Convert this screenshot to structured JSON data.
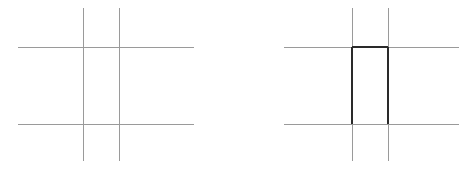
{
  "figure": {
    "background_color": "#ffffff",
    "width": 466,
    "height": 170,
    "panel_count": 2
  },
  "colors": {
    "grid_line": "#9a9a9a",
    "highlight_line": "#2a2a2a",
    "background": "#ffffff"
  },
  "strokes": {
    "grid_width": 1,
    "highlight_width": 2
  },
  "panels": [
    {
      "id": "left",
      "name": "plain-grid-panel",
      "caption": "",
      "origin_x": 0,
      "highlight": false,
      "vertical_lines": [
        {
          "name": "vertical-line-1",
          "x": 83,
          "y1": 8,
          "y2": 161
        },
        {
          "name": "vertical-line-2",
          "x": 119,
          "y1": 8,
          "y2": 161
        }
      ],
      "horizontal_lines": [
        {
          "name": "horizontal-line-top",
          "y": 47,
          "x1": 18,
          "x2": 194
        },
        {
          "name": "horizontal-line-bottom",
          "y": 124,
          "x1": 18,
          "x2": 194
        }
      ]
    },
    {
      "id": "right",
      "name": "highlighted-grid-panel",
      "caption": "",
      "origin_x": 233,
      "highlight": true,
      "vertical_lines": [
        {
          "name": "vertical-line-1",
          "x": 119,
          "y1": 8,
          "y2": 161
        },
        {
          "name": "vertical-line-2",
          "x": 155,
          "y1": 8,
          "y2": 161
        }
      ],
      "horizontal_lines": [
        {
          "name": "horizontal-line-top",
          "y": 47,
          "x1": 51,
          "x2": 226
        },
        {
          "name": "horizontal-line-bottom",
          "y": 124,
          "x1": 51,
          "x2": 226
        }
      ],
      "highlight_cell": {
        "name": "selected-cell",
        "left": 119,
        "right": 155,
        "top": 47,
        "bottom": 124,
        "edges_drawn": [
          "top",
          "left",
          "right"
        ],
        "bottom_edge_drawn": false
      }
    }
  ]
}
